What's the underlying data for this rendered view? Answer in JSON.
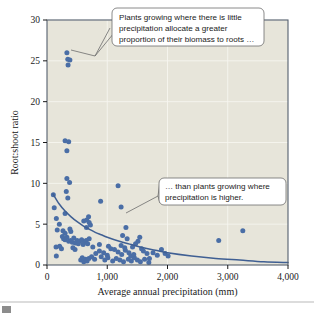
{
  "chart_data": {
    "type": "scatter",
    "title": "",
    "xlabel": "Average annual precipitation (mm)",
    "ylabel": "Root:shoot ratio",
    "xlim": [
      0,
      4000
    ],
    "ylim": [
      0,
      30
    ],
    "xticks": [
      0,
      1000,
      2000,
      3000,
      4000
    ],
    "xtick_labels": [
      "0",
      "1,000",
      "2,000",
      "3,000",
      "4,000"
    ],
    "yticks": [
      0,
      5,
      10,
      15,
      20,
      25,
      30
    ],
    "ytick_labels": [
      "0",
      "5",
      "10",
      "15",
      "20",
      "25",
      "30"
    ],
    "grid": true,
    "legend": null,
    "series": [
      {
        "name": "Root:shoot ratio vs precipitation",
        "marker": "circle",
        "color": "#4a6ea6",
        "points": [
          [
            330,
            26.0
          ],
          [
            345,
            25.2
          ],
          [
            350,
            24.5
          ],
          [
            380,
            25.1
          ],
          [
            300,
            15.2
          ],
          [
            360,
            15.1
          ],
          [
            330,
            14.0
          ],
          [
            330,
            10.6
          ],
          [
            375,
            10.1
          ],
          [
            320,
            9.0
          ],
          [
            1180,
            9.7
          ],
          [
            105,
            8.6
          ],
          [
            345,
            8.2
          ],
          [
            890,
            7.8
          ],
          [
            1230,
            7.1
          ],
          [
            120,
            7.0
          ],
          [
            155,
            5.7
          ],
          [
            300,
            6.3
          ],
          [
            205,
            5.0
          ],
          [
            610,
            5.4
          ],
          [
            660,
            5.5
          ],
          [
            700,
            5.2
          ],
          [
            720,
            4.9
          ],
          [
            690,
            5.9
          ],
          [
            655,
            4.6
          ],
          [
            170,
            4.3
          ],
          [
            265,
            4.2
          ],
          [
            380,
            4.4
          ],
          [
            395,
            4.1
          ],
          [
            300,
            3.9
          ],
          [
            1310,
            4.6
          ],
          [
            1255,
            3.6
          ],
          [
            1330,
            3.2
          ],
          [
            3250,
            4.2
          ],
          [
            2850,
            3.0
          ],
          [
            255,
            3.5
          ],
          [
            275,
            3.2
          ],
          [
            300,
            3.1
          ],
          [
            330,
            3.4
          ],
          [
            360,
            2.9
          ],
          [
            390,
            3.0
          ],
          [
            420,
            2.8
          ],
          [
            445,
            3.3
          ],
          [
            470,
            2.7
          ],
          [
            500,
            3.0
          ],
          [
            520,
            2.6
          ],
          [
            545,
            2.9
          ],
          [
            575,
            3.1
          ],
          [
            600,
            2.5
          ],
          [
            625,
            2.8
          ],
          [
            650,
            3.0
          ],
          [
            675,
            2.6
          ],
          [
            700,
            3.2
          ],
          [
            430,
            2.1
          ],
          [
            465,
            1.9
          ],
          [
            150,
            2.2
          ],
          [
            155,
            1.1
          ],
          [
            240,
            2.0
          ],
          [
            210,
            2.3
          ],
          [
            760,
            2.2
          ],
          [
            810,
            1.4
          ],
          [
            870,
            1.7
          ],
          [
            940,
            1.5
          ],
          [
            1000,
            1.2
          ],
          [
            1060,
            2.0
          ],
          [
            1120,
            1.9
          ],
          [
            1180,
            1.6
          ],
          [
            1240,
            1.3
          ],
          [
            1300,
            1.8
          ],
          [
            1360,
            1.5
          ],
          [
            1420,
            2.2
          ],
          [
            1470,
            2.6
          ],
          [
            1510,
            2.9
          ],
          [
            1540,
            3.4
          ],
          [
            1570,
            2.0
          ],
          [
            1600,
            1.7
          ],
          [
            1660,
            1.4
          ],
          [
            1700,
            0.8
          ],
          [
            1760,
            1.5
          ],
          [
            1830,
            1.2
          ],
          [
            1900,
            1.9
          ],
          [
            1960,
            1.4
          ],
          [
            2010,
            1.1
          ],
          [
            560,
            0.6
          ],
          [
            585,
            0.9
          ],
          [
            610,
            0.4
          ],
          [
            640,
            0.7
          ],
          [
            665,
            0.5
          ],
          [
            695,
            0.8
          ],
          [
            960,
            0.6
          ],
          [
            1010,
            0.9
          ],
          [
            1090,
            0.5
          ],
          [
            1150,
            0.8
          ],
          [
            1210,
            0.6
          ],
          [
            1270,
            0.4
          ],
          [
            1350,
            0.7
          ],
          [
            1400,
            0.5
          ],
          [
            1450,
            0.9
          ],
          [
            1500,
            0.6
          ],
          [
            1550,
            0.4
          ],
          [
            1620,
            0.7
          ],
          [
            1690,
            0.3
          ],
          [
            1230,
            2.4
          ],
          [
            1290,
            2.1
          ],
          [
            1390,
            1.1
          ],
          [
            1440,
            1.3
          ],
          [
            870,
            2.5
          ],
          [
            900,
            1.0
          ],
          [
            1020,
            2.3
          ],
          [
            740,
            1.0
          ],
          [
            790,
            0.7
          ]
        ]
      }
    ],
    "trend": {
      "name": "fitted decay curve",
      "color": "#3f5f93",
      "description": "Negative exponential decline from about 8.7 at low precipitation toward near 0 at 4,000 mm",
      "points": [
        [
          100,
          8.7
        ],
        [
          200,
          7.5
        ],
        [
          300,
          6.6
        ],
        [
          400,
          5.9
        ],
        [
          500,
          5.3
        ],
        [
          600,
          4.8
        ],
        [
          700,
          4.4
        ],
        [
          800,
          4.0
        ],
        [
          900,
          3.7
        ],
        [
          1000,
          3.4
        ],
        [
          1200,
          2.9
        ],
        [
          1400,
          2.5
        ],
        [
          1600,
          2.1
        ],
        [
          1800,
          1.8
        ],
        [
          2000,
          1.5
        ],
        [
          2400,
          1.1
        ],
        [
          2800,
          0.8
        ],
        [
          3200,
          0.6
        ],
        [
          3600,
          0.4
        ],
        [
          4000,
          0.3
        ]
      ]
    },
    "annotations": [
      {
        "id": "callout-top",
        "text_lines": [
          "Plants growing where there is little",
          "precipitation allocate a greater",
          "proportion of their biomass to roots …"
        ],
        "points_to": [
          380,
          25.6
        ]
      },
      {
        "id": "callout-bottom",
        "text_lines": [
          "… than plants growing where",
          "precipitation is higher."
        ],
        "points_to": [
          1330,
          6.2
        ]
      }
    ]
  }
}
